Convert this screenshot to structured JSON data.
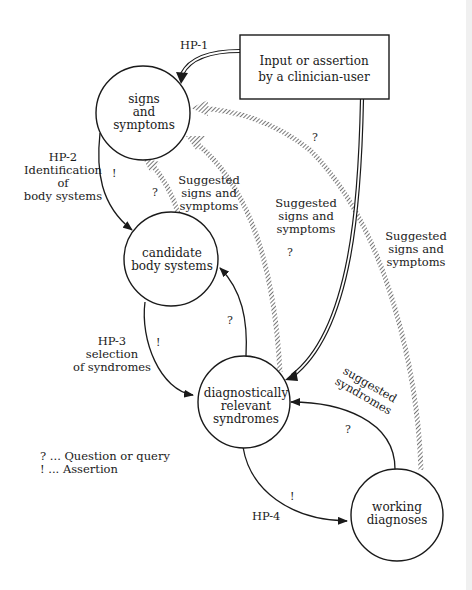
{
  "diagram": {
    "nodes": {
      "signs_symptoms": {
        "line1": "signs",
        "line2": "and",
        "line3": "symptoms"
      },
      "candidate_body_systems": {
        "line1": "candidate",
        "line2": "body systems"
      },
      "diagnostically_relevant": {
        "line1": "diagnostically",
        "line2": "relevant",
        "line3": "syndromes"
      },
      "working_diagnoses": {
        "line1": "working",
        "line2": "diagnoses"
      },
      "clinician_input": {
        "line1": "Input or assertion",
        "line2": "by a clinician-user"
      }
    },
    "edge_labels": {
      "hp1": "HP-1",
      "hp2": {
        "line1": "HP-2",
        "line2": "Identification",
        "line3": "of",
        "line4": "body systems"
      },
      "hp3": {
        "line1": "HP-3",
        "line2": "selection",
        "line3": "of syndromes"
      },
      "hp4": "HP-4",
      "suggested_ss_1": {
        "line1": "Suggested",
        "line2": "signs and",
        "line3": "symptoms"
      },
      "suggested_ss_2": {
        "line1": "Suggested",
        "line2": "signs and",
        "line3": "symptoms"
      },
      "suggested_ss_3": {
        "line1": "Suggested",
        "line2": "signs and",
        "line3": "symptoms"
      },
      "suggested_syndromes": {
        "line1": "suggested",
        "line2": "syndromes"
      }
    },
    "marks": {
      "question": "?",
      "assertion": "!"
    },
    "legend": {
      "question": "? ... Question or query",
      "assertion": "!  ... Assertion"
    }
  }
}
